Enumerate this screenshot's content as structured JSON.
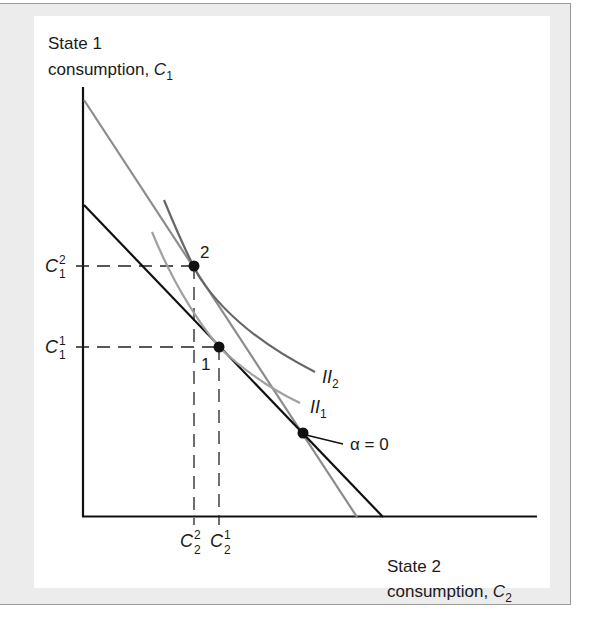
{
  "figure": {
    "y_axis_label": {
      "line1": "State 1",
      "line2": "consumption, ",
      "var": "C",
      "sub": "1"
    },
    "x_axis_label": {
      "line1": "State 2",
      "line2": "consumption, ",
      "var": "C",
      "sub": "2"
    },
    "ticks": {
      "y": [
        {
          "var": "C",
          "sup": "2",
          "sub": "1"
        },
        {
          "var": "C",
          "sup": "1",
          "sub": "1"
        }
      ],
      "x": [
        {
          "var": "C",
          "sup": "2",
          "sub": "2"
        },
        {
          "var": "C",
          "sup": "1",
          "sub": "2"
        }
      ]
    },
    "curves": [
      {
        "name": "II",
        "sub": "2"
      },
      {
        "name": "II",
        "sub": "1"
      }
    ],
    "points": {
      "p2": "2",
      "p1": "1",
      "alpha0": "α = 0"
    }
  },
  "colors": {
    "axis": "#111111",
    "budget_black": "#111111",
    "budget_gray": "#8c8c8c",
    "ii2": "#666666",
    "ii1": "#a0a0a0",
    "frame_band": "#ececec",
    "frame_border": "#9a9a9a"
  }
}
